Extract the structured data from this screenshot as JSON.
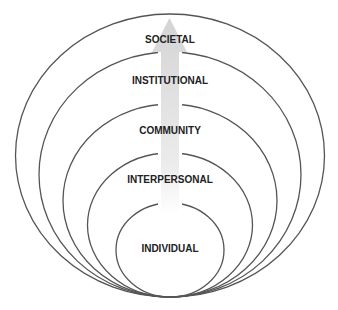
{
  "diagram": {
    "type": "nested-ellipses",
    "colors": {
      "ring_stroke": "#555555",
      "label_text": "#222222",
      "arrow_fill_top": "#d9d9d9",
      "arrow_fill_bottom": "#ffffff",
      "background": "#ffffff"
    },
    "levels": [
      {
        "label": "SOCIETAL",
        "cx": 170,
        "cy": 155.5,
        "rx": 154.5,
        "ry": 141.5,
        "label_y": 40
      },
      {
        "label": "INSTITUTIONAL",
        "cx": 170,
        "cy": 174.5,
        "rx": 131,
        "ry": 122.5,
        "label_y": 81
      },
      {
        "label": "COMMUNITY",
        "cx": 170,
        "cy": 200.5,
        "rx": 107,
        "ry": 96.5,
        "label_y": 131
      },
      {
        "label": "INTERPERSONAL",
        "cx": 170,
        "cy": 225,
        "rx": 82.5,
        "ry": 72,
        "label_y": 180
      },
      {
        "label": "INDIVIDUAL",
        "cx": 170,
        "cy": 250,
        "rx": 54,
        "ry": 47,
        "label_y": 249
      }
    ],
    "arrow": {
      "direction": "up",
      "tip_y": 18,
      "head_base_y": 52,
      "head_left_x": 152,
      "head_right_x": 187,
      "shaft_left_x": 161,
      "shaft_right_x": 179,
      "shaft_bottom_y": 215
    }
  }
}
